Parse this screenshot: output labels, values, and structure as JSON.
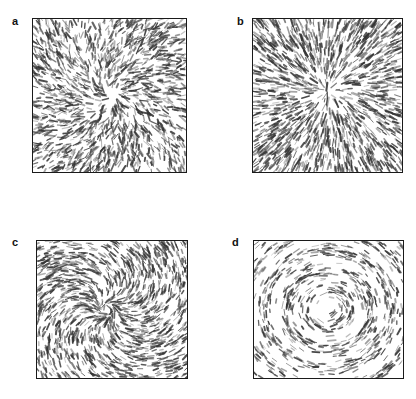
{
  "figure": {
    "background_color": "#ffffff",
    "border_color": "#1a1a1a",
    "stroke_color": "#333333",
    "layout": "2x2 grid of square panels",
    "width": 416,
    "height": 399
  },
  "panels": [
    {
      "id": "a",
      "label": "a",
      "pattern": "aster",
      "description": "Radial vector field; short dark dashes oriented along radii emanating from a diffuse centre, denser and more disordered near the middle."
    },
    {
      "id": "b",
      "label": "b",
      "pattern": "aster",
      "description": "Sharp radial aster; dashes point outward from a well defined central core, with a small low-density hole at the centre."
    },
    {
      "id": "c",
      "label": "c",
      "pattern": "spiral",
      "description": "Spiral vortex; dashes follow logarithmic spiral arms winding counter-clockwise about the centre."
    },
    {
      "id": "d",
      "label": "d",
      "pattern": "vortex",
      "description": "Circular vortex; dashes lie tangentially along concentric rings around the centre."
    }
  ],
  "chart_data": {
    "type": "scatter",
    "title": "",
    "xlabel": "",
    "ylabel": "",
    "subplots": [
      {
        "label": "a",
        "pattern": "aster",
        "field": "radial",
        "center": [
          0.5,
          0.5
        ],
        "n_segments": 1500,
        "segment_length": 0.022,
        "swirl": 0.18,
        "jitter": 0.55,
        "core_radius": 0.1,
        "density_profile": "uniform",
        "seed": 11
      },
      {
        "label": "b",
        "pattern": "aster",
        "field": "radial",
        "center": [
          0.5,
          0.47
        ],
        "n_segments": 1600,
        "segment_length": 0.024,
        "swirl": 0.05,
        "jitter": 0.22,
        "core_radius": 0.07,
        "density_profile": "center-depleted",
        "seed": 23
      },
      {
        "label": "c",
        "pattern": "spiral",
        "field": "spiral",
        "center": [
          0.47,
          0.5
        ],
        "n_segments": 1500,
        "segment_length": 0.022,
        "swirl": 0.85,
        "jitter": 0.3,
        "core_radius": 0.05,
        "density_profile": "uniform",
        "seed": 37
      },
      {
        "label": "d",
        "pattern": "vortex",
        "field": "tangential",
        "center": [
          0.5,
          0.5
        ],
        "n_segments": 1500,
        "segment_length": 0.022,
        "swirl": 1.0,
        "jitter": 0.2,
        "core_radius": 0.04,
        "density_profile": "ring-banded",
        "seed": 53
      }
    ],
    "grid": false,
    "legend": null
  }
}
